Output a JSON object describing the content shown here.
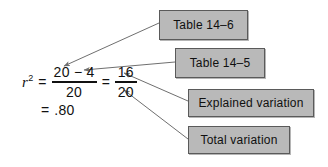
{
  "figure": {
    "type": "annotated-equation-diagram",
    "background_color": "#ffffff",
    "box_fill_color": "#b9b9b9",
    "box_border_color": "#5a5a5a",
    "text_color": "#111111",
    "arrow_color": "#6f6f6f"
  },
  "equation": {
    "symbol": "r",
    "exponent": "2",
    "equals_1": "=",
    "fraction_1": {
      "numerator": "20 − 4",
      "denominator": "20"
    },
    "equals_2": "=",
    "fraction_2": {
      "numerator": "16",
      "denominator": "20"
    },
    "equals_3": "=",
    "result": ".80"
  },
  "callouts": [
    {
      "id": "table-14-6",
      "label": "Table 14–6",
      "points_to": "numerator of first fraction"
    },
    {
      "id": "table-14-5",
      "label": "Table 14–5",
      "points_to": "the 4 in the numerator"
    },
    {
      "id": "explained-variation",
      "label": "Explained variation",
      "points_to": "16"
    },
    {
      "id": "total-variation",
      "label": "Total variation",
      "points_to": "20"
    }
  ]
}
